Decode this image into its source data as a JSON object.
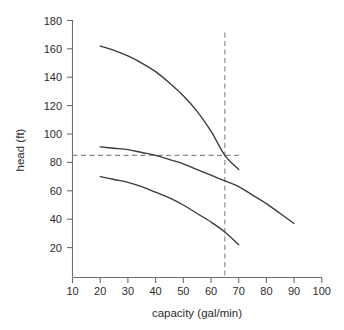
{
  "chart_data": {
    "type": "line",
    "title": "",
    "xlabel": "capacity (gal/min)",
    "ylabel": "head (ft)",
    "xlim": [
      10,
      100
    ],
    "ylim": [
      0,
      180
    ],
    "xticks": [
      10,
      20,
      30,
      40,
      50,
      60,
      70,
      80,
      90,
      100
    ],
    "yticks": [
      20,
      40,
      60,
      80,
      100,
      120,
      140,
      160,
      180
    ],
    "grid": false,
    "legend": "none",
    "line_color": "#3a3a3a",
    "guide_color": "#8a8a8a",
    "axis_color": "#6d6d6d",
    "series": [
      {
        "name": "upper-curve",
        "x": [
          20,
          25,
          30,
          35,
          40,
          45,
          50,
          55,
          60,
          65,
          70
        ],
        "y": [
          162,
          159,
          155,
          150,
          144,
          136,
          127,
          116,
          102,
          85,
          75
        ]
      },
      {
        "name": "middle-curve",
        "x": [
          20,
          25,
          30,
          35,
          40,
          45,
          50,
          55,
          60,
          65,
          70,
          75,
          80,
          85,
          90
        ],
        "y": [
          91,
          90,
          89,
          87,
          85,
          82,
          79,
          75,
          71,
          67,
          63,
          57,
          51,
          44,
          37
        ]
      },
      {
        "name": "lower-curve",
        "x": [
          20,
          25,
          30,
          35,
          40,
          45,
          50,
          55,
          60,
          65,
          70
        ],
        "y": [
          70,
          68,
          66,
          63,
          59,
          55,
          50,
          44,
          38,
          31,
          22
        ]
      }
    ],
    "annotations": [
      {
        "name": "operating-point-guides",
        "type": "crosshair",
        "x": 65,
        "y": 85,
        "style": "dashed"
      }
    ],
    "tick_labels": {
      "x": [
        "10",
        "20",
        "30",
        "40",
        "50",
        "60",
        "70",
        "80",
        "90",
        "100"
      ],
      "y": [
        "20",
        "40",
        "60",
        "80",
        "100",
        "120",
        "140",
        "160",
        "180"
      ]
    }
  }
}
